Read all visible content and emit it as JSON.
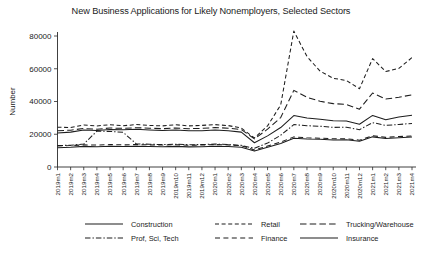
{
  "chart_data": {
    "type": "line",
    "title": "New Business Applications for Likely Nonemployers, Selected Sectors",
    "xlabel": "",
    "ylabel": "Number",
    "ylim": [
      0,
      80000
    ],
    "yticks": [
      0,
      20000,
      40000,
      60000,
      80000
    ],
    "ytick_labels": [
      "0",
      "20000",
      "40000",
      "60000",
      "80000"
    ],
    "grid": false,
    "legend_position": "bottom",
    "categories": [
      "2019m1",
      "2019m2",
      "2019m3",
      "2019m4",
      "2019m5",
      "2019m6",
      "2019m7",
      "2019m8",
      "2019m9",
      "2019m10",
      "2019m11",
      "2019m12",
      "2020m1",
      "2020m2",
      "2020m3",
      "2020m4",
      "2020m5",
      "2020m6",
      "2020m7",
      "2020m8",
      "2020m9",
      "2020m10",
      "2020m11",
      "2020m12",
      "2021m1",
      "2021m2",
      "2021m3",
      "2021m4"
    ],
    "series": [
      {
        "name": "Retail",
        "dash": "4,2.6",
        "values": [
          24300,
          24100,
          25600,
          25100,
          25800,
          25200,
          25900,
          25400,
          25100,
          25800,
          25100,
          25400,
          25900,
          25300,
          23800,
          17700,
          25100,
          37900,
          83000,
          67500,
          58500,
          54200,
          52800,
          47800,
          66200,
          58300,
          60200,
          66800
        ]
      },
      {
        "name": "Trucking/Warehouse",
        "dash": "6.5,3.2",
        "values": [
          22200,
          22500,
          23500,
          23100,
          23800,
          23600,
          24000,
          23700,
          23400,
          23800,
          23400,
          23600,
          24100,
          23700,
          22900,
          17200,
          23100,
          30200,
          46800,
          42600,
          40100,
          38700,
          38200,
          35300,
          45200,
          41500,
          42600,
          44100
        ]
      },
      {
        "name": "Construction",
        "dash": "none",
        "values": [
          20800,
          21300,
          22600,
          22300,
          22900,
          22700,
          23000,
          22600,
          22300,
          22600,
          22100,
          22200,
          22600,
          22200,
          21300,
          14800,
          19000,
          24100,
          31400,
          29900,
          29200,
          28300,
          28100,
          26100,
          31500,
          28900,
          30500,
          31600
        ]
      },
      {
        "name": "Prof, Sci, Tech",
        "dash": "5.5,2,1.4,2",
        "values": [
          13100,
          13300,
          14000,
          21900,
          21700,
          21200,
          14100,
          13900,
          13700,
          13900,
          13600,
          13700,
          14000,
          13700,
          13200,
          11400,
          14600,
          19400,
          25900,
          25200,
          24900,
          24200,
          24300,
          22800,
          27100,
          25400,
          26000,
          26600
        ]
      },
      {
        "name": "Finance",
        "dash": "5,3.4",
        "values": [
          12900,
          13100,
          13500,
          13400,
          13700,
          13500,
          13700,
          13500,
          13400,
          13600,
          13300,
          13400,
          13700,
          13500,
          13000,
          10400,
          12800,
          15200,
          18400,
          17800,
          17600,
          17200,
          17300,
          16400,
          19100,
          18100,
          18600,
          18900
        ]
      },
      {
        "name": "Insurance",
        "dash": "none",
        "values": [
          11800,
          12000,
          12600,
          12400,
          12700,
          12500,
          12700,
          12500,
          12400,
          12600,
          12300,
          12400,
          12700,
          12500,
          12000,
          9700,
          12000,
          14400,
          17600,
          17100,
          16900,
          16500,
          16600,
          15700,
          18400,
          17400,
          17900,
          18300
        ]
      }
    ],
    "legend_entries": [
      {
        "label": "Construction",
        "dash": "none"
      },
      {
        "label": "Retail",
        "dash": "4,2.6"
      },
      {
        "label": "Trucking/Warehouse",
        "dash": "6.5,3.2"
      },
      {
        "label": "Prof, Sci, Tech",
        "dash": "5.5,2,1.4,2"
      },
      {
        "label": "Finance",
        "dash": "5,3.4"
      },
      {
        "label": "Insurance",
        "dash": "none"
      }
    ],
    "colors": {
      "line": "#1d1d1d",
      "axis": "#2a2a2a",
      "text": "#1b1b1b",
      "background": "#ffffff"
    }
  }
}
